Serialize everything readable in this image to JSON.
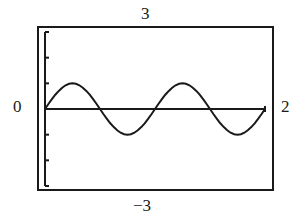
{
  "chart_data": {
    "type": "line",
    "title": "",
    "xlabel": "",
    "ylabel": "",
    "function": "y = sin(2*pi*x)",
    "xlim": [
      0,
      2
    ],
    "ylim": [
      -3,
      3
    ],
    "window_labels": {
      "ymax": "3",
      "ymin": "−3",
      "xmin": "0",
      "xmax": "2"
    },
    "y_ticks": [
      -3,
      -2,
      -1,
      0,
      1,
      2,
      3
    ],
    "grid": false,
    "legend": null,
    "series": [
      {
        "name": "sin(2πx)",
        "x": [
          0,
          0.125,
          0.25,
          0.375,
          0.5,
          0.625,
          0.75,
          0.875,
          1.0,
          1.125,
          1.25,
          1.375,
          1.5,
          1.625,
          1.75,
          1.875,
          2.0
        ],
        "values": [
          0,
          0.71,
          1,
          0.71,
          0,
          -0.71,
          -1,
          -0.71,
          0,
          0.71,
          1,
          0.71,
          0,
          -0.71,
          -1,
          -0.71,
          0
        ]
      }
    ]
  },
  "colors": {
    "ink": "#1a1a1a",
    "background": "#ffffff"
  }
}
